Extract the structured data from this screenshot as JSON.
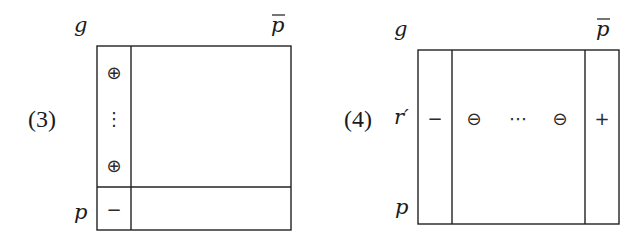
{
  "figures": [
    {
      "id": "3",
      "label": "(3)",
      "top_left_label": "g",
      "top_right_label": "p",
      "top_right_overbar": true,
      "bottom_left_label": "p",
      "column_symbols": [
        "⊕",
        "⋮",
        "⊕"
      ],
      "bottom_row_symbol": "−"
    },
    {
      "id": "4",
      "label": "(4)",
      "top_left_label": "g",
      "top_right_label": "p",
      "top_right_overbar": true,
      "row_label": "r′",
      "bottom_left_label": "p",
      "row_symbols": {
        "left_column": "−",
        "middle": [
          "⊖",
          "⋯",
          "⊖"
        ],
        "right_column": "+"
      }
    }
  ]
}
